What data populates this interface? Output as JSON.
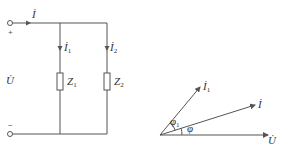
{
  "circuit": {
    "current_total": {
      "symbol": "İ",
      "sub": ""
    },
    "current_branch1": {
      "symbol": "İ",
      "sub": "1"
    },
    "current_branch2": {
      "symbol": "İ",
      "sub": "2"
    },
    "voltage": {
      "symbol": "U̇"
    },
    "plus_sign": "+",
    "minus_sign": "−",
    "impedance1": {
      "symbol": "Z",
      "sub": "1"
    },
    "impedance2": {
      "symbol": "Z",
      "sub": "2"
    }
  },
  "phasor": {
    "voltage": {
      "symbol": "U̇"
    },
    "current_total": {
      "symbol": "İ"
    },
    "current_branch1": {
      "symbol": "İ",
      "sub": "1"
    },
    "angle_total": {
      "symbol": "φ"
    },
    "angle_branch1": {
      "symbol": "φ",
      "sub": "1"
    }
  },
  "colors": {
    "line": "#555555",
    "text": "#333333",
    "background": "#ffffff"
  }
}
